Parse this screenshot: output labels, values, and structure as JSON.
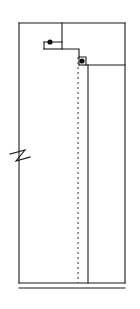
{
  "drawing": {
    "title": "Vertical Section Detail",
    "type": "technical-line-drawing",
    "canvas": {
      "width": 140,
      "height": 309
    },
    "background_color": "#ffffff",
    "line_color": "#1a1a1a",
    "dot_color": "#111111",
    "stroke_width": 1.1,
    "bounds": {
      "left": 19,
      "right": 125,
      "top": 23,
      "bottom": 288
    },
    "outline_path": "M19,23 L125,23 L125,283 L19,283 Z",
    "top_edge": {
      "y": 23,
      "x1": 19,
      "x2": 125
    },
    "left_edge": {
      "x": 19,
      "y1": 23,
      "y2": 283
    },
    "right_edge": {
      "x": 125,
      "y1": 23,
      "y2": 283
    },
    "base_lines": [
      {
        "y": 283,
        "x1": 19,
        "x2": 125
      },
      {
        "y": 288,
        "x1": 19,
        "x2": 125
      }
    ],
    "upper_partition": {
      "x": 62,
      "y1": 23,
      "y2": 42
    },
    "step_profile_path": "M44,42 L62,42 L62,49 L79,49 L79,57 L86,57 L86,65 L125,65",
    "step_return": {
      "x": 44,
      "y1": 42,
      "y2": 49,
      "x2": 62
    },
    "notch_upper": {
      "x1": 44,
      "y1": 42,
      "x2": 62,
      "y2": 49
    },
    "notch_lower": {
      "x1": 79,
      "y1": 57,
      "x2": 86,
      "y2": 65
    },
    "shelf_line": {
      "y": 65,
      "x1": 86,
      "x2": 125
    },
    "centerline": {
      "x": 78,
      "y1": 57,
      "y2": 283,
      "style": "dashed",
      "dash_pattern": "2 3"
    },
    "interior_vertical": {
      "x": 88,
      "y1": 65,
      "y2": 283
    },
    "break_symbol": {
      "x": 19,
      "y": 160,
      "path": "M10,154 L25,150 L16,161 L30,157",
      "label": "break-line"
    },
    "nodes": [
      {
        "id": "node-upper",
        "cx": 50,
        "cy": 42,
        "r": 2.6,
        "label": "connection-point-1"
      },
      {
        "id": "node-lower",
        "cx": 82,
        "cy": 61,
        "r": 2.6,
        "label": "connection-point-2"
      }
    ]
  }
}
